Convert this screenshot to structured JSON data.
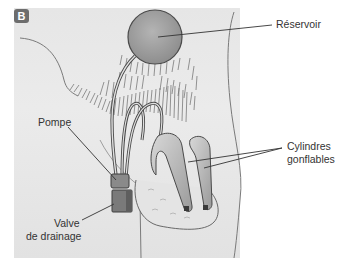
{
  "figure": {
    "panel_badge": "B",
    "labels": {
      "reservoir": "Réservoir",
      "pump": "Pompe",
      "cylinders_line1": "Cylindres",
      "cylinders_line2": "gonflables",
      "valve_line1": "Valve",
      "valve_line2": "de drainage"
    },
    "colors": {
      "panel_background": "#e8e8e8",
      "reservoir_fill": "#a8a8a8",
      "outline": "#4a4a4a",
      "hair": "#6a6a6a",
      "badge": "#6d6d6d"
    }
  }
}
